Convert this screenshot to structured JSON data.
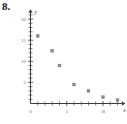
{
  "figure": {
    "problem_number": "8.",
    "x_axis_name": "x",
    "y_axis_name": "y"
  },
  "chart_data": {
    "type": "scatter",
    "title": "",
    "subtitle": "",
    "xlabel": "x",
    "ylabel": "y",
    "xlim": [
      0,
      12.6
    ],
    "ylim": [
      0,
      21.5
    ],
    "grid": false,
    "legend": null,
    "x_tick_labels": [
      "0",
      "5",
      "10"
    ],
    "x_tick_values": [
      0,
      5,
      10
    ],
    "x_minor_tick_step": 1,
    "y_tick_labels": [
      "5",
      "10",
      "15",
      "20"
    ],
    "y_tick_values": [
      5,
      10,
      15,
      20
    ],
    "y_minor_tick_step": 1,
    "marker": "square",
    "marker_color": "#8a8a8a",
    "points": [
      {
        "x": 1,
        "y": 16
      },
      {
        "x": 3,
        "y": 12.5
      },
      {
        "x": 4,
        "y": 9
      },
      {
        "x": 6,
        "y": 4.5
      },
      {
        "x": 8,
        "y": 3
      },
      {
        "x": 10,
        "y": 1.5
      },
      {
        "x": 12,
        "y": 0.8
      }
    ]
  }
}
